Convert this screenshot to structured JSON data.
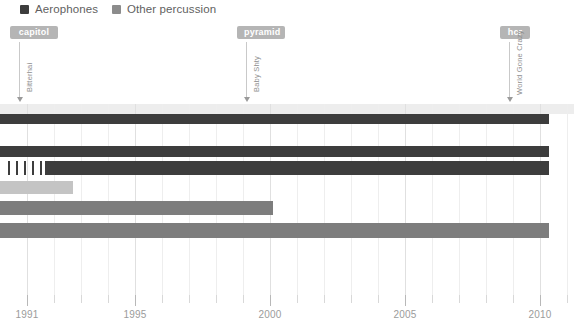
{
  "legend": {
    "items": [
      {
        "label": "Aerophones",
        "color": "#3d3d3d",
        "x": 20
      },
      {
        "label": "Other percussion",
        "color": "#8c8c8c",
        "x": 112
      }
    ]
  },
  "annotations": [
    {
      "chip_label": "capitol",
      "chip_color": "#b5b5b5",
      "chip_x": 10,
      "chip_w": 48,
      "vertical_label": "Bitterhai",
      "marker_x": 19,
      "stem_top": 42,
      "stem_height": 55,
      "text_x": 17,
      "text_y": 92
    },
    {
      "chip_label": "pyramid",
      "chip_color": "#b5b5b5",
      "chip_x": 237,
      "chip_w": 48,
      "vertical_label": "Baby Shty",
      "marker_x": 246,
      "stem_top": 42,
      "stem_height": 55,
      "text_x": 244,
      "text_y": 92
    },
    {
      "chip_label": "hcr",
      "chip_color": "#b5b5b5",
      "chip_x": 500,
      "chip_w": 30,
      "vertical_label": "World Gone Crazy",
      "marker_x": 509,
      "stem_top": 42,
      "stem_height": 55,
      "text_x": 507,
      "text_y": 95
    }
  ],
  "chart_data": {
    "type": "bar",
    "orientation": "horizontal",
    "title": "",
    "xlabel": "",
    "ylabel": "",
    "xlim": [
      1990.6,
      2011.8
    ],
    "grid": true,
    "legend_position": "top-left",
    "x_ticks": [
      {
        "value": 1991,
        "label": "1991",
        "px": 27,
        "major": true
      },
      {
        "value": 1992,
        "label": "",
        "px": 54,
        "major": false
      },
      {
        "value": 1993,
        "label": "",
        "px": 81,
        "major": false
      },
      {
        "value": 1994,
        "label": "",
        "px": 108,
        "major": false
      },
      {
        "value": 1995,
        "label": "1995",
        "px": 135,
        "major": true
      },
      {
        "value": 1996,
        "label": "",
        "px": 162,
        "major": false
      },
      {
        "value": 1997,
        "label": "",
        "px": 189,
        "major": false
      },
      {
        "value": 1998,
        "label": "",
        "px": 216,
        "major": false
      },
      {
        "value": 1999,
        "label": "",
        "px": 243,
        "major": false
      },
      {
        "value": 2000,
        "label": "2000",
        "px": 270,
        "major": true
      },
      {
        "value": 2001,
        "label": "",
        "px": 297,
        "major": false
      },
      {
        "value": 2002,
        "label": "",
        "px": 324,
        "major": false
      },
      {
        "value": 2003,
        "label": "",
        "px": 351,
        "major": false
      },
      {
        "value": 2004,
        "label": "",
        "px": 378,
        "major": false
      },
      {
        "value": 2005,
        "label": "2005",
        "px": 405,
        "major": true
      },
      {
        "value": 2006,
        "label": "",
        "px": 432,
        "major": false
      },
      {
        "value": 2007,
        "label": "",
        "px": 459,
        "major": false
      },
      {
        "value": 2008,
        "label": "",
        "px": 486,
        "major": false
      },
      {
        "value": 2009,
        "label": "",
        "px": 513,
        "major": false
      },
      {
        "value": 2010,
        "label": "2010",
        "px": 540,
        "major": true
      },
      {
        "value": 2011,
        "label": "",
        "px": 567,
        "major": false
      }
    ],
    "series": [
      {
        "name": "Aerophones",
        "color": "#3d3d3d"
      },
      {
        "name": "Other percussion",
        "color": "#8c8c8c"
      }
    ],
    "bars": [
      {
        "index": 0,
        "series": "Aerophones",
        "color": "#3d3d3d",
        "start_year": 1990.6,
        "end_year": 2011.0,
        "x": 0,
        "w": 549,
        "y": 10,
        "h": 10,
        "style": "solid",
        "cap": true
      },
      {
        "index": 1,
        "series": "Aerophones",
        "color": "#3d3d3d",
        "start_year": 1990.6,
        "end_year": 2011.0,
        "x": 0,
        "w": 549,
        "y": 42,
        "h": 11,
        "style": "solid",
        "cap": true
      },
      {
        "index": 2,
        "series": "Aerophones",
        "color": "#3d3d3d",
        "start_year": 1992.3,
        "end_year": 2011.0,
        "x": 45,
        "w": 504,
        "y": 57,
        "h": 14,
        "style": "solid",
        "cap": false,
        "dashes": {
          "x": 8,
          "count": 5,
          "spacing": 8,
          "color": "#3d3d3d"
        }
      },
      {
        "index": 3,
        "series": "Other percussion",
        "color": "#c4c4c4",
        "start_year": 1990.6,
        "end_year": 1993.3,
        "x": 0,
        "w": 73,
        "y": 77,
        "h": 13,
        "style": "solid",
        "cap": true
      },
      {
        "index": 4,
        "series": "Other percussion",
        "color": "#7d7d7d",
        "start_year": 1990.6,
        "end_year": 2000.1,
        "x": 0,
        "w": 273,
        "y": 97,
        "h": 14,
        "style": "solid",
        "cap": true
      },
      {
        "index": 5,
        "series": "Other percussion",
        "color": "#7d7d7d",
        "start_year": 1990.6,
        "end_year": 2011.0,
        "x": 0,
        "w": 549,
        "y": 119,
        "h": 15,
        "style": "solid",
        "cap": true
      }
    ]
  }
}
